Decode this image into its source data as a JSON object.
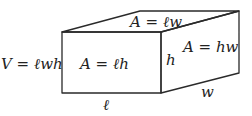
{
  "diagram": {
    "colors": {
      "stroke": "#2a2a2a",
      "text": "#222222",
      "background": "#ffffff"
    },
    "vertices": {
      "front_top_left": [
        62,
        32
      ],
      "front_top_right": [
        161,
        32
      ],
      "front_bottom_left": [
        62,
        93
      ],
      "front_bottom_right": [
        161,
        93
      ],
      "back_top_left": [
        140,
        11
      ],
      "back_top_right": [
        239,
        11
      ],
      "back_bottom_right": [
        239,
        73
      ]
    },
    "labels": {
      "volume": "V = ℓwh",
      "front_area": "A = ℓh",
      "top_area": "A = ℓw",
      "side_area": "A =  hw",
      "height": "h",
      "length": "ℓ",
      "width": "w"
    }
  }
}
